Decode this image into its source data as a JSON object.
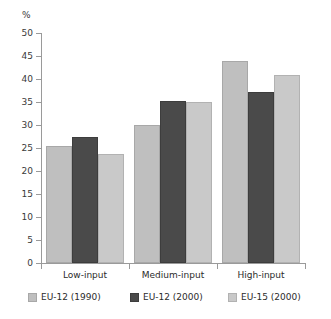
{
  "chart_data": {
    "type": "bar",
    "title": "",
    "subtitle": "",
    "xlabel": "",
    "ylabel": "%",
    "unit_label": "%",
    "ylim": [
      0,
      50
    ],
    "ytick_step": 5,
    "yticks": [
      0,
      5,
      10,
      15,
      20,
      25,
      30,
      35,
      40,
      45,
      50
    ],
    "ytick_labels": [
      "0",
      "5",
      "10",
      "15",
      "20",
      "25",
      "30",
      "35",
      "40",
      "45",
      "50"
    ],
    "grid": false,
    "legend_position": "bottom",
    "categories": [
      "Low-input",
      "Medium-input",
      "High-input"
    ],
    "series": [
      {
        "name": "EU-12 (1990)",
        "color": "#bfbfbf",
        "values": [
          25.5,
          30.1,
          44.0
        ]
      },
      {
        "name": "EU-12 (2000)",
        "color": "#4a4a4a",
        "values": [
          27.5,
          35.2,
          37.2
        ]
      },
      {
        "name": "EU-15 (2000)",
        "color": "#c9c9c9",
        "values": [
          23.7,
          35.0,
          40.8
        ]
      }
    ]
  },
  "axis": {
    "line_color": "#9a9a9a",
    "tick_color": "#9a9a9a"
  }
}
